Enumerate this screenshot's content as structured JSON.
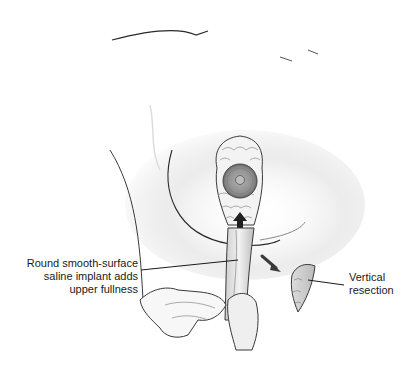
{
  "figure": {
    "type": "medical-illustration",
    "colors": {
      "background": "#ffffff",
      "line": "#2a2a2a",
      "shading": "#c8c8c8",
      "areola": "#9a9a9a"
    }
  },
  "labels": {
    "implant": {
      "lines": [
        "Round smooth-surface",
        "saline implant adds",
        "upper fullness"
      ]
    },
    "resection": {
      "lines": [
        "Vertical",
        "resection"
      ]
    }
  }
}
